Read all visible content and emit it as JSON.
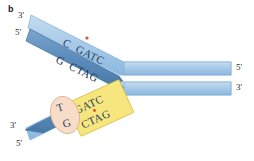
{
  "figure": {
    "panel_letter": "b",
    "type": "dna-replication-fork-mismatch-repair-diagram",
    "background_color": "#ffffff"
  },
  "colors": {
    "strand_light_blue": "#a9cbe8",
    "strand_light_blue_edge": "#7fb0d8",
    "strand_dark_blue": "#5f8fbe",
    "strand_dark_blue_edge": "#44709c",
    "gatc_box_fill": "#f7e67e",
    "gatc_box_edge": "#d9bf4a",
    "mismatch_oval_fill": "#f7ddc8",
    "mismatch_oval_edge": "#d8ab8a",
    "methyl_dot": "#d9522b",
    "text_dark": "#1f3c5c",
    "label_text": "#2b2b2b"
  },
  "labels": {
    "upper_left_top": "3'",
    "upper_left_bottom": "5'",
    "lower_left_top": "3'",
    "lower_left_bottom": "5'",
    "right_top": "5'",
    "right_bottom": "3'"
  },
  "upper_duplex": {
    "template_strand_sequence": "C  GATC",
    "template_strand_color": "light-blue",
    "complementary_strand_sequence": "G  CTAG",
    "complementary_strand_color": "dark-blue",
    "methyl_mark": "methyl-group-dot",
    "methyl_mark_position": "above-A-of-GATC-on-light-blue-strand"
  },
  "lower_duplex": {
    "gatc_box": {
      "top_sequence": "GATC",
      "bottom_sequence": "CTAG",
      "methyl_mark": "methyl-group-dot",
      "methyl_mark_position": "between-GATC-and-CTAG"
    },
    "mismatch_bubble": {
      "top_base": "T",
      "bottom_base": "G"
    }
  }
}
